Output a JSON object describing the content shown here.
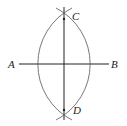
{
  "diagram": {
    "type": "perpendicular-bisector-construction",
    "labels": {
      "A": "A",
      "B": "B",
      "C": "C",
      "D": "D"
    },
    "points": {
      "A": [
        19,
        64
      ],
      "B": [
        109,
        64
      ],
      "C": [
        64,
        19
      ],
      "D": [
        64,
        110
      ]
    },
    "colors": {
      "stroke": "#222222",
      "arc": "#555555",
      "background": "#ffffff"
    }
  }
}
